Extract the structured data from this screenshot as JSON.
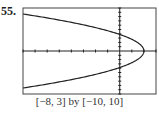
{
  "problem_number": "55.",
  "caption": "[−8, 3] by [−10, 10]",
  "chart_data": {
    "type": "line",
    "title": "",
    "xlim": [
      -8,
      3
    ],
    "ylim": [
      -10,
      10
    ],
    "xtick_step": 1,
    "ytick_step": 1,
    "vertex": [
      2,
      0
    ],
    "y_intercepts": [
      3.8,
      -3.8
    ],
    "endpoints_at_left_edge": [
      [
        -8,
        8.6
      ],
      [
        -8,
        -8.6
      ]
    ],
    "grid": false,
    "xlabel": "",
    "ylabel": ""
  }
}
